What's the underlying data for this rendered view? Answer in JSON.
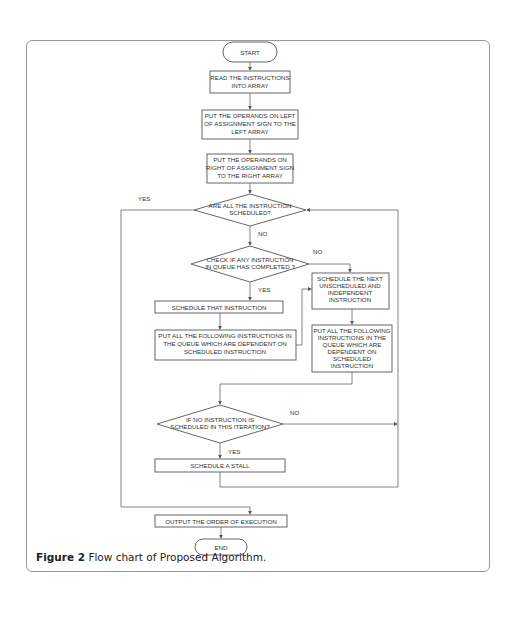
{
  "caption": {
    "label": "Figure 2",
    "text": "Flow chart of Proposed Algorithm."
  },
  "nodes": {
    "start": "START",
    "read": [
      "READ THE INSTRUCTIONS",
      "INTO  ARRAY"
    ],
    "left_operands": [
      "PUT  THE OPERANDS ON LEFT",
      "OF ASSIGNMENT SIGN TO THE",
      "LEFT ARRAY"
    ],
    "right_operands": [
      "PUT  THE OPERANDS ON",
      "RIGHT OF ASSIGNMENT SIGN",
      "TO THE RIGHT ARRAY"
    ],
    "all_scheduled": [
      "ARE ALL THE INSTRUCTION",
      "SCHEDULED?"
    ],
    "any_completed": [
      "CHECK IF ANY INSTRUCTION",
      "IN QUEUE  HAS COMPLETED ?"
    ],
    "schedule_that": "SCHEDULE THAT INSTRUCTION",
    "put_dependent_left": [
      "PUT ALL THE FOLLOWING INSTRUCTIONS IN",
      "THE QUEUE WHICH ARE DEPENDENT ON",
      "SCHEDULED INSTRUCTION"
    ],
    "schedule_next": [
      "SCHEDULE  THE NEXT",
      "UNSCHEDULED AND",
      "INDEPENDENT",
      "INSTRUCTION"
    ],
    "put_dependent_right": [
      "PUT ALL THE FOLLOWING",
      "INSTRUCTIONS IN THE",
      "QUEUE WHICH ARE",
      "DEPENDENT ON",
      "SCHEDULED",
      "INSTRUCTION"
    ],
    "no_instruction": [
      "IF NO INSTRUCTION IS",
      "SCHEDULED IN THIS ITERATION?"
    ],
    "stall": "SCHEDULE A STALL",
    "output": "OUTPUT THE ORDER OF EXECUTION",
    "end": "END"
  },
  "edge_labels": {
    "yes_all": "YES",
    "no_all": "NO",
    "no_completed": "NO",
    "yes_completed": "YES",
    "no_iteration": "NO",
    "yes_iteration": "YES"
  }
}
